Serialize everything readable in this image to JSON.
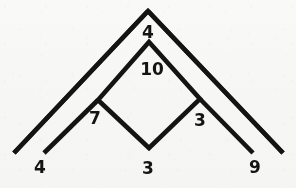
{
  "figure": {
    "type": "line-diagram",
    "canvas": {
      "width": 296,
      "height": 188
    },
    "colors": {
      "background": "#fbfbfa",
      "stroke": "#141414",
      "label": "#141414"
    },
    "stroke_width": 4.6,
    "vertices": {
      "outer_apex": [
        148,
        11
      ],
      "outer_left_end": [
        14,
        153
      ],
      "outer_right_end": [
        283,
        153
      ],
      "diamond_top": [
        149,
        42
      ],
      "diamond_left": [
        98,
        100
      ],
      "diamond_right": [
        200,
        99
      ],
      "diamond_bottom": [
        149,
        148
      ],
      "inner_left_end": [
        44,
        153
      ],
      "inner_right_end": [
        253,
        153
      ]
    },
    "segments": [
      {
        "name": "outer-left-arm",
        "from": "outer_apex",
        "to": "outer_left_end"
      },
      {
        "name": "outer-right-arm",
        "from": "outer_apex",
        "to": "outer_right_end"
      },
      {
        "name": "diamond-top-left-edge",
        "from": "diamond_top",
        "to": "diamond_left"
      },
      {
        "name": "diamond-top-right-edge",
        "from": "diamond_top",
        "to": "diamond_right"
      },
      {
        "name": "diamond-bottom-left-edge",
        "from": "diamond_left",
        "to": "diamond_bottom"
      },
      {
        "name": "diamond-bottom-right-edge",
        "from": "diamond_right",
        "to": "diamond_bottom"
      },
      {
        "name": "inner-left-arm",
        "from": "diamond_left",
        "to": "inner_left_end"
      },
      {
        "name": "inner-right-arm",
        "from": "diamond_right",
        "to": "inner_right_end"
      }
    ],
    "labels": [
      {
        "name": "label-apex-4",
        "text": "4",
        "x": 148,
        "y": 32
      },
      {
        "name": "label-diamond-10",
        "text": "10",
        "x": 152,
        "y": 69
      },
      {
        "name": "label-left-7",
        "text": "7",
        "x": 95,
        "y": 118
      },
      {
        "name": "label-right-3",
        "text": "3",
        "x": 200,
        "y": 120
      },
      {
        "name": "label-bottom-left-4",
        "text": "4",
        "x": 40,
        "y": 167
      },
      {
        "name": "label-bottom-3",
        "text": "3",
        "x": 148,
        "y": 168
      },
      {
        "name": "label-bottom-right-9",
        "text": "9",
        "x": 255,
        "y": 167
      }
    ]
  }
}
